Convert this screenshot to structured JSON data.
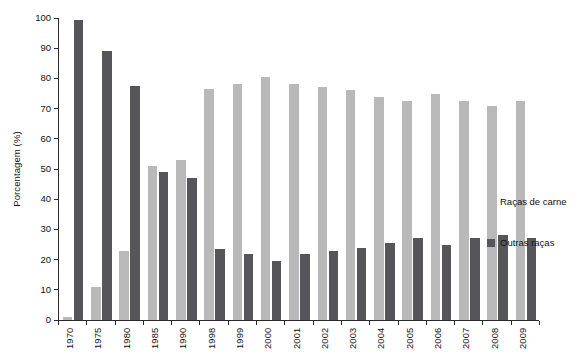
{
  "chart_data": {
    "type": "bar",
    "title": "",
    "xlabel": "",
    "ylabel": "Porcentagem (%)",
    "ylim": [
      0,
      100
    ],
    "ytick_step": 10,
    "yticks": [
      0,
      10,
      20,
      30,
      40,
      50,
      60,
      70,
      80,
      90,
      100
    ],
    "grid": false,
    "legend_position": "right",
    "categories": [
      "1970",
      "1975",
      "1980",
      "1985",
      "1990",
      "1998",
      "1999",
      "2000",
      "2001",
      "2002",
      "2003",
      "2004",
      "2005",
      "2006",
      "2007",
      "2008",
      "2009"
    ],
    "series": [
      {
        "name": "Raças de carne",
        "color": "#b9b9b9",
        "values": [
          1,
          11,
          23,
          51,
          53,
          76.5,
          78,
          80.5,
          78,
          77,
          76,
          74,
          72.5,
          75,
          72.5,
          71,
          72.5
        ]
      },
      {
        "name": "Outras raças",
        "color": "#56565a",
        "values": [
          99.5,
          89,
          77.5,
          49,
          47,
          23.5,
          22,
          19.5,
          22,
          23,
          24,
          25.5,
          27,
          25,
          27,
          28,
          27
        ]
      }
    ]
  },
  "legend": {
    "items": [
      {
        "label": "Raças de carne",
        "color": "#b9b9b9"
      },
      {
        "label": "Outras raças",
        "color": "#56565a"
      }
    ]
  },
  "colors": {
    "series_light": "#b9b9b9",
    "series_dark": "#56565a",
    "axis": "#2a2a2a",
    "text": "#111111",
    "background": "#ffffff"
  }
}
